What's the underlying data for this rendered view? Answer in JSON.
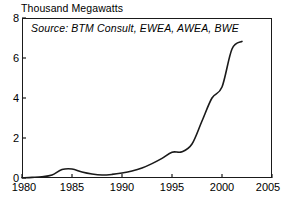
{
  "chart_data": {
    "type": "line",
    "title": "Thousand Megawatts",
    "xlabel": "",
    "ylabel": "Thousand Megawatts",
    "annotation": "Source: BTM Consult, EWEA, AWEA, BWE",
    "grid": false,
    "legend": "none",
    "xlim": [
      1980,
      2005
    ],
    "ylim": [
      0,
      8
    ],
    "xticks": [
      "1980",
      "1985",
      "1990",
      "1995",
      "2000",
      "2005"
    ],
    "xtick_values": [
      1980,
      1985,
      1990,
      1995,
      2000,
      2005
    ],
    "yticks": [
      "0",
      "2",
      "4",
      "6",
      "8"
    ],
    "ytick_values": [
      0,
      2,
      4,
      6,
      8
    ],
    "series": [
      {
        "name": "World Wind Energy Generating Capacity",
        "color": "#1a1a1a",
        "x": [
          1980,
          1981,
          1982,
          1983,
          1984,
          1985,
          1986,
          1987,
          1988,
          1989,
          1990,
          1991,
          1992,
          1993,
          1994,
          1995,
          1996,
          1997,
          1998,
          1999,
          2000,
          2001,
          2002
        ],
        "values": [
          0.01,
          0.03,
          0.06,
          0.15,
          0.42,
          0.45,
          0.3,
          0.2,
          0.15,
          0.18,
          0.25,
          0.35,
          0.5,
          0.72,
          0.98,
          1.29,
          1.31,
          1.7,
          2.85,
          4.0,
          4.55,
          6.45,
          6.83
        ]
      }
    ]
  },
  "axis": {
    "title_text": "Thousand Megawatts"
  }
}
